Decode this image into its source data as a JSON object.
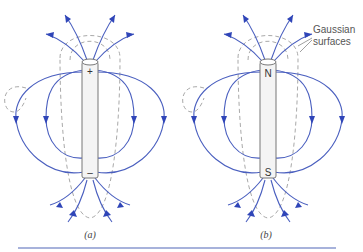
{
  "panels": [
    {
      "id": "a",
      "caption": "(a)",
      "object": "charged rod (electric dipole)",
      "top_label": "+",
      "bottom_label": "–"
    },
    {
      "id": "b",
      "caption": "(b)",
      "object": "bar magnet (magnetic dipole)",
      "top_label": "N",
      "bottom_label": "S"
    }
  ],
  "annotation": {
    "line1": "Gaussian",
    "line2": "surfaces"
  },
  "colors": {
    "field_line": "#4a5fbf",
    "arrowhead": "#2f45b8",
    "gaussian_surface": "#a9a9a9",
    "rule": "#8a98cf"
  }
}
